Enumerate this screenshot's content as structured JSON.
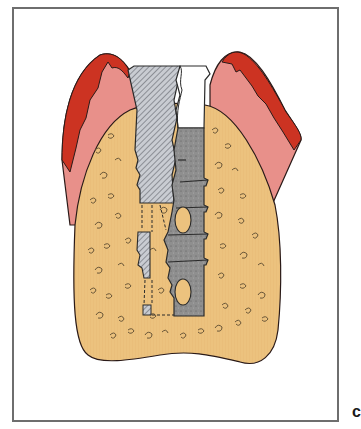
{
  "figure": {
    "panel_label": "c",
    "parts": [
      {
        "name": "gingiva",
        "color": "#e8908a"
      },
      {
        "name": "gingival-epithelium",
        "color": "#cc3322"
      },
      {
        "name": "alveolar-bone",
        "color": "#ecc27e"
      },
      {
        "name": "implant-body",
        "color": "#8e8e8e"
      },
      {
        "name": "tooth-hatched-section",
        "color": "#b8bcc4"
      },
      {
        "name": "abutment-top",
        "color": "#ffffff"
      }
    ],
    "frame_color": "#6e6e6e"
  }
}
